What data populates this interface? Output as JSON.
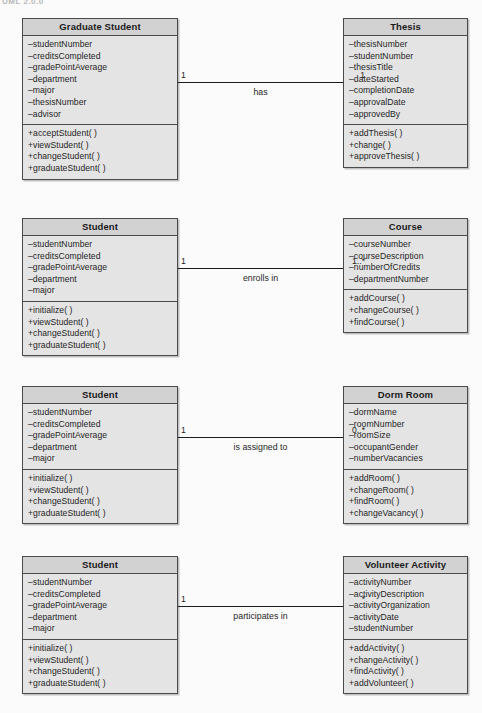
{
  "page": {
    "header_fragment": "UML 2.0.0",
    "background_color": "#fbfbfb",
    "box_header_color": "#d2d2d2",
    "box_body_color": "#e4e4e4",
    "border_color": "#4a4a4a",
    "line_color": "#1c1c1c"
  },
  "diagram": {
    "type": "uml-class-diagram",
    "groups": [
      {
        "id": "graduate-student-thesis",
        "top": 18,
        "line_top": 82,
        "source": {
          "name": "Graduate Student",
          "attributes": [
            "–studentNumber",
            "–creditsCompleted",
            "–gradePointAverage",
            "–department",
            "–major",
            "–thesisNumber",
            "–advisor"
          ],
          "operations": [
            "+acceptStudent( )",
            "+viewStudent( )",
            "+changeStudent( )",
            "+graduateStudent( )"
          ]
        },
        "target": {
          "name": "Thesis",
          "attributes": [
            "–thesisNumber",
            "–studentNumber",
            "–thesisTitle",
            "–dateStarted",
            "–completionDate",
            "–approvalDate",
            "–approvedBy"
          ],
          "operations": [
            "+addThesis( )",
            "+change( )",
            "+approveThesis( )"
          ]
        },
        "association": {
          "label": "has",
          "source_multiplicity": "1",
          "target_multiplicity": "1"
        }
      },
      {
        "id": "student-course",
        "top": 218,
        "line_top": 268,
        "source": {
          "name": "Student",
          "attributes": [
            "–studentNumber",
            "–creditsCompleted",
            "–gradePointAverage",
            "–department",
            "–major"
          ],
          "operations": [
            "+initialize( )",
            "+viewStudent( )",
            "+changeStudent( )",
            "+graduateStudent( )"
          ]
        },
        "target": {
          "name": "Course",
          "attributes": [
            "–courseNumber",
            "–courseDescription",
            "–numberOfCredits",
            "–departmentNumber"
          ],
          "operations": [
            "+addCourse( )",
            "+changeCourse( )",
            "+findCourse( )"
          ]
        },
        "association": {
          "label": "enrolls in",
          "source_multiplicity": "1",
          "target_multiplicity": "1..*"
        }
      },
      {
        "id": "student-dorm-room",
        "top": 386,
        "line_top": 437,
        "source": {
          "name": "Student",
          "attributes": [
            "–studentNumber",
            "–creditsCompleted",
            "–gradePointAverage",
            "–department",
            "–major"
          ],
          "operations": [
            "+initialize( )",
            "+viewStudent( )",
            "+changeStudent( )",
            "+graduateStudent( )"
          ]
        },
        "target": {
          "name": "Dorm Room",
          "attributes": [
            "–dormName",
            "–roomNumber",
            "–roomSize",
            "–occupantGender",
            "–numberVacancies"
          ],
          "operations": [
            "+addRoom( )",
            "+changeRoom( )",
            "+findRoom( )",
            "+changeVacancy( )"
          ]
        },
        "association": {
          "label": "is assigned to",
          "source_multiplicity": "1",
          "target_multiplicity": "0..*"
        }
      },
      {
        "id": "student-volunteer-activity",
        "top": 556,
        "line_top": 606,
        "source": {
          "name": "Student",
          "attributes": [
            "–studentNumber",
            "–creditsCompleted",
            "–gradePointAverage",
            "–department",
            "–major"
          ],
          "operations": [
            "+initialize( )",
            "+viewStudent( )",
            "+changeStudent( )",
            "+graduateStudent( )"
          ]
        },
        "target": {
          "name": "Volunteer Activity",
          "attributes": [
            "–activityNumber",
            "–activityDescription",
            "–activityOrganization",
            "–activityDate",
            "–studentNumber"
          ],
          "operations": [
            "+addActivity( )",
            "+changeActivity( )",
            "+findActivity( )",
            "+addVolunteer( )"
          ]
        },
        "association": {
          "label": "participates in",
          "source_multiplicity": "1",
          "target_multiplicity": "*"
        }
      }
    ]
  }
}
